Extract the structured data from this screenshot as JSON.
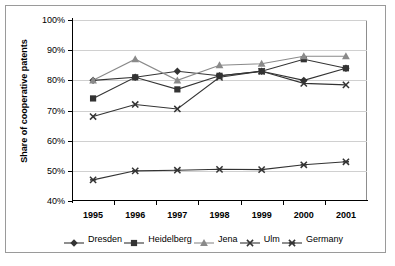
{
  "chart_data": {
    "type": "line",
    "title": "",
    "xlabel": "",
    "ylabel": "Share of cooperative patents",
    "categories": [
      "1995",
      "1996",
      "1997",
      "1998",
      "1999",
      "2000",
      "2001"
    ],
    "ylim": [
      40,
      100
    ],
    "ytick_labels": [
      "40%",
      "50%",
      "60%",
      "70%",
      "80%",
      "90%",
      "100%"
    ],
    "ytick_values": [
      40,
      50,
      60,
      70,
      80,
      90,
      100
    ],
    "grid": true,
    "legend_position": "bottom",
    "series": [
      {
        "name": "Dresden",
        "marker": "diamond",
        "color": "#333333",
        "values": [
          80.0,
          81.0,
          83.0,
          81.5,
          83.0,
          80.0,
          84.0
        ]
      },
      {
        "name": "Heidelberg",
        "marker": "square",
        "color": "#333333",
        "values": [
          74.0,
          81.0,
          77.0,
          81.5,
          83.0,
          87.0,
          84.0
        ]
      },
      {
        "name": "Jena",
        "marker": "triangle",
        "color": "#8a8a8a",
        "values": [
          80.0,
          87.0,
          80.0,
          85.0,
          85.5,
          88.0,
          88.0
        ]
      },
      {
        "name": "Ulm",
        "marker": "cross",
        "color": "#333333",
        "values": [
          68.0,
          72.0,
          70.5,
          81.0,
          83.0,
          79.0,
          78.5
        ]
      },
      {
        "name": "Germany",
        "marker": "star",
        "color": "#333333",
        "values": [
          47.0,
          50.0,
          50.2,
          50.5,
          50.4,
          52.0,
          53.0
        ]
      }
    ]
  }
}
